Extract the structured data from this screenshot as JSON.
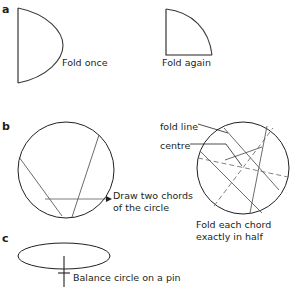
{
  "figure": {
    "background": "#ffffff",
    "stroke_color": "#231f20",
    "panels": [
      {
        "id": "a",
        "label": "a",
        "captions": [
          "Fold once",
          "Fold again"
        ],
        "shapes": [
          "half-circle",
          "quarter-circle"
        ]
      },
      {
        "id": "b",
        "label": "b",
        "captions": [
          "Draw two chords of the circle",
          "fold line",
          "centre",
          "Fold each chord exactly in half"
        ],
        "shapes": [
          "circle-with-two-chords",
          "circle-with-fold-lines"
        ]
      },
      {
        "id": "c",
        "label": "c",
        "captions": [
          "Balance circle on a pin"
        ],
        "shapes": [
          "ellipse-on-pin"
        ]
      }
    ]
  },
  "labels": {
    "panel_a": "a",
    "panel_b": "b",
    "panel_c": "c"
  },
  "captions": {
    "fold_once": "Fold once",
    "fold_again": "Fold again",
    "draw_two_chords": "Draw two chords\nof the circle",
    "fold_line": "fold line",
    "centre": "centre",
    "fold_each_chord": "Fold each chord\nexactly in half",
    "balance_on_pin": "Balance circle on a pin"
  },
  "colors": {
    "ink": "#231f20",
    "paper": "#ffffff",
    "thin_line": "#4a4a4a"
  }
}
